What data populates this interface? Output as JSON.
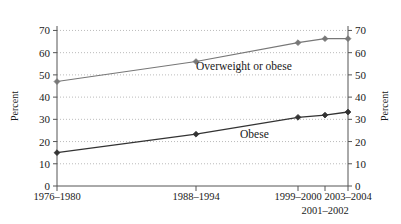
{
  "chart_data": {
    "type": "line",
    "title": "",
    "subtitle": "",
    "xlabel": "",
    "ylabel": "Percent",
    "ylabel_right": "Percent",
    "ylim": [
      0,
      72
    ],
    "yticks": [
      0,
      10,
      20,
      30,
      40,
      50,
      60,
      70
    ],
    "ytick_labels": [
      "0",
      "10",
      "20",
      "30",
      "40",
      "50",
      "60",
      "70"
    ],
    "ytick_labels_right": [
      "0",
      "10",
      "20",
      "30",
      "40",
      "50",
      "60",
      "70"
    ],
    "grid": true,
    "grid_style": "dotted",
    "legend": "inline-annotations",
    "categories": [
      "1976–1980",
      "1988–1994",
      "1999–2000",
      "2001–2002",
      "2003–2004"
    ],
    "category_label_rows": [
      {
        "text": "1976–1980",
        "row": 1
      },
      {
        "text": "1988–1994",
        "row": 1
      },
      {
        "text": "1999–2000",
        "row": 1
      },
      {
        "text": "2001–2002",
        "row": 2
      },
      {
        "text": "2003–2004",
        "row": 1
      }
    ],
    "series": [
      {
        "name": "Overweight or obese",
        "color": "#777777",
        "values": [
          47.0,
          56.0,
          64.5,
          66.3,
          66.3
        ]
      },
      {
        "name": "Obese",
        "color": "#333333",
        "values": [
          15.0,
          23.3,
          30.9,
          31.9,
          33.3
        ]
      }
    ],
    "annotations": [
      {
        "text": "Overweight or obese",
        "series": "Overweight or obese"
      },
      {
        "text": "Obese",
        "series": "Obese"
      }
    ]
  },
  "colors": {
    "axis": "#555555",
    "grid": "#aaaaaa",
    "text": "#1a1a1a",
    "series_overweight": "#777777",
    "series_obese": "#333333",
    "background": "#ffffff"
  }
}
